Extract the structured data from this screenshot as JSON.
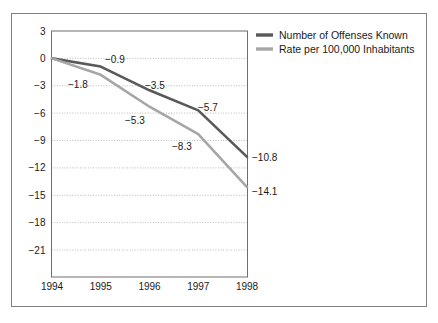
{
  "chart_data": {
    "type": "line",
    "title": "",
    "subtitle": "",
    "xlabel": "",
    "ylabel": "",
    "x": [
      "1994",
      "1995",
      "1996",
      "1997",
      "1998"
    ],
    "categories": [
      "1994",
      "1995",
      "1996",
      "1997",
      "1998"
    ],
    "xticklabels": [
      "1994",
      "1995",
      "1996",
      "1997",
      "1998"
    ],
    "yticklabels": [
      "3",
      "0",
      "-3",
      "-6",
      "-9",
      "-12",
      "-15",
      "-18",
      "-21"
    ],
    "ytickvalues": [
      3,
      0,
      -3,
      -6,
      -9,
      -12,
      -15,
      -18,
      -21
    ],
    "ylim": [
      -22.5,
      3
    ],
    "xlim": [
      "1994",
      "1998"
    ],
    "grid": "horizontal-dotted",
    "legend_position": "top-right-outside",
    "series": [
      {
        "name": "Number of Offenses Known",
        "color": "#595959",
        "values": [
          0,
          -0.9,
          -3.5,
          -5.7,
          -10.8
        ],
        "point_labels": [
          "",
          "−0.9",
          "−3.5",
          "−5.7",
          "−10.8"
        ]
      },
      {
        "name": "Rate per 100,000 Inhabitants",
        "color": "#a6a6a6",
        "values": [
          0,
          -1.8,
          -5.3,
          -8.3,
          -14.1
        ],
        "point_labels": [
          "",
          "−1.8",
          "−5.3",
          "−8.3",
          "−14.1"
        ]
      }
    ],
    "annotations": [
      {
        "text": "−0.9",
        "x": 105,
        "y": 63,
        "anchor": "start"
      },
      {
        "text": "−1.8",
        "x": 68,
        "y": 88,
        "anchor": "start"
      },
      {
        "text": "−3.5",
        "x": 145,
        "y": 89,
        "anchor": "start"
      },
      {
        "text": "−5.3",
        "x": 125,
        "y": 124,
        "anchor": "start"
      },
      {
        "text": "−5.7",
        "x": 198,
        "y": 111,
        "anchor": "start"
      },
      {
        "text": "−8.3",
        "x": 172,
        "y": 150,
        "anchor": "start"
      },
      {
        "text": "−10.8",
        "x": 252,
        "y": 161,
        "anchor": "start"
      },
      {
        "text": "−14.1",
        "x": 252,
        "y": 195,
        "anchor": "start"
      }
    ]
  },
  "axes": {
    "y_ticks": [
      {
        "label": "3",
        "y": 31
      },
      {
        "label": "0",
        "y": 58.4
      },
      {
        "label": "−3",
        "y": 85.8
      },
      {
        "label": "−6",
        "y": 113.1
      },
      {
        "label": "−9",
        "y": 140.5
      },
      {
        "label": "−12",
        "y": 167.9
      },
      {
        "label": "−15",
        "y": 195.3
      },
      {
        "label": "−18",
        "y": 222.6
      },
      {
        "label": "−21",
        "y": 250
      }
    ],
    "x_ticks": [
      {
        "label": "1994",
        "x": 52
      },
      {
        "label": "1995",
        "x": 100.75
      },
      {
        "label": "1996",
        "x": 149.5
      },
      {
        "label": "1997",
        "x": 198.25
      },
      {
        "label": "1998",
        "x": 247
      }
    ]
  },
  "legend": {
    "items": [
      {
        "label": "Number of Offenses Known",
        "color": "#595959"
      },
      {
        "label": "Rate per 100,000 Inhabitants",
        "color": "#a6a6a6"
      }
    ]
  },
  "colors": {
    "series_dark": "#595959",
    "series_light": "#a6a6a6",
    "frame": "#808080",
    "plot_border": "#6e6e6e",
    "gridline": "#b9b9b9",
    "text": "#1a1a1a",
    "background": "#ffffff"
  }
}
